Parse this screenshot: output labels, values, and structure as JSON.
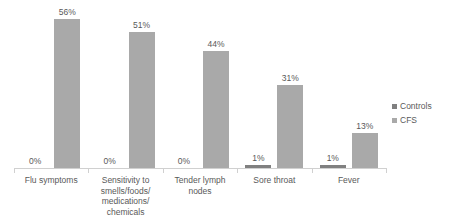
{
  "chart_data": {
    "type": "bar",
    "title": "",
    "subtitle": "",
    "xlabel": "",
    "ylabel": "",
    "ylim": [
      0,
      60
    ],
    "grid": false,
    "legend_position": "right",
    "value_suffix": "%",
    "categories": [
      "Flu symptoms",
      "Sensitivity to smells/foods/medications/chemicals",
      "Tender lymph nodes",
      "Sore throat",
      "Fever"
    ],
    "category_lines": [
      [
        "Flu symptoms"
      ],
      [
        "Sensitivity to",
        "smells/foods/",
        "medications/",
        "chemicals"
      ],
      [
        "Tender lymph",
        "nodes"
      ],
      [
        "Sore throat"
      ],
      [
        "Fever"
      ]
    ],
    "series": [
      {
        "name": "Controls",
        "color": "#808080",
        "values": [
          0,
          0,
          0,
          1,
          1
        ],
        "labels": [
          "0%",
          "0%",
          "0%",
          "1%",
          "1%"
        ]
      },
      {
        "name": "CFS",
        "color": "#a9a9a9",
        "values": [
          56,
          51,
          44,
          31,
          13
        ],
        "labels": [
          "56%",
          "51%",
          "44%",
          "31%",
          "13%"
        ]
      }
    ]
  },
  "legend": {
    "items": [
      {
        "label": "Controls",
        "color": "#808080"
      },
      {
        "label": "CFS",
        "color": "#a9a9a9"
      }
    ]
  }
}
